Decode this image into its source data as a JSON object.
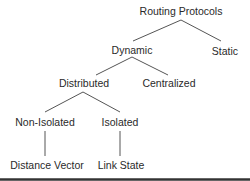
{
  "diagram": {
    "type": "tree",
    "colors": {
      "text": "#2a2a2a",
      "edge": "#555555",
      "rule": "#333333"
    },
    "nodes": {
      "root": {
        "label": "Routing Protocols",
        "x": 181,
        "y": 15
      },
      "dynamic": {
        "label": "Dynamic",
        "x": 132,
        "y": 54
      },
      "static": {
        "label": "Static",
        "x": 225,
        "y": 55
      },
      "distributed": {
        "label": "Distributed",
        "x": 84,
        "y": 87
      },
      "centralized": {
        "label": "Centralized",
        "x": 169,
        "y": 87
      },
      "non_isolated": {
        "label": "Non-Isolated",
        "x": 45,
        "y": 126
      },
      "isolated": {
        "label": "Isolated",
        "x": 120,
        "y": 126
      },
      "distance_vector": {
        "label": "Distance Vector",
        "x": 47,
        "y": 169
      },
      "link_state": {
        "label": "Link State",
        "x": 121,
        "y": 169
      }
    },
    "edges": [
      {
        "from": "Routing Protocols",
        "to": "Dynamic"
      },
      {
        "from": "Routing Protocols",
        "to": "Static"
      },
      {
        "from": "Dynamic",
        "to": "Distributed"
      },
      {
        "from": "Dynamic",
        "to": "Centralized"
      },
      {
        "from": "Distributed",
        "to": "Non-Isolated"
      },
      {
        "from": "Distributed",
        "to": "Isolated"
      },
      {
        "from": "Non-Isolated",
        "to": "Distance Vector"
      },
      {
        "from": "Isolated",
        "to": "Link State"
      }
    ]
  }
}
